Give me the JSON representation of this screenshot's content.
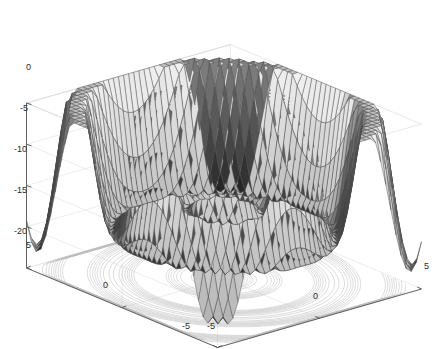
{
  "figure": {
    "type": "matlab-surfc-3d-surface",
    "background_color": "#ffffff",
    "width": 444,
    "height": 349
  },
  "chart_data": {
    "type": "surface",
    "title": "",
    "xlabel": "",
    "ylabel": "",
    "zlabel": "",
    "grid": true,
    "legend": null,
    "legend_position": "none",
    "style": "matlab surfc (surface with base contour projection), grayscale colormap",
    "projection": "3d axonometric, default MATLAB view az=-37.5 el=30",
    "xlim": [
      -5,
      5
    ],
    "ylim": [
      -5,
      5
    ],
    "zlim": [
      -20,
      0
    ],
    "x_ticks": [
      -5,
      0,
      5
    ],
    "y_ticks": [
      -5,
      0,
      5
    ],
    "z_ticks": [
      0,
      -5,
      -10,
      -15,
      -20
    ],
    "x_tick_labels": [
      "-5",
      "0",
      "5"
    ],
    "y_tick_labels": [
      "5",
      "0",
      "-5"
    ],
    "z_tick_labels": [
      "0",
      "-5",
      "-10",
      "-15",
      "-20"
    ],
    "surface": {
      "description": "Radially symmetric damped oscillating function; central dome peaks near z=0 surrounded by concentric ripple rings decreasing to about z=-20, with four outer wave crests rising back toward z=-5 at the domain corners/edges",
      "formula": "z = -abs(r) + A*cos(k*r) envelope, r = sqrt(x^2+y^2)",
      "grid_n": 41,
      "amplitude": 9.5,
      "wavenumber": 2.35,
      "decay": 0.0,
      "slope": 1.05,
      "offset": -1.0,
      "z_peak": 0.0,
      "z_min": -20.0
    },
    "colormap": {
      "name": "gray",
      "low": "#141414",
      "mid": "#9a9a9a",
      "high": "#f2f2f2"
    },
    "mesh": {
      "edge_color": "#4a4a4a",
      "edge_width": 0.45,
      "visible": true
    },
    "contour": {
      "visible": true,
      "levels": 10,
      "color": "#b9b9b9",
      "plane_z": -20
    },
    "axes": {
      "line_color": "#555555",
      "grid_color": "#e4e4e4",
      "box": true,
      "tick_color": "#2b2b2b"
    }
  },
  "tick_labels": {
    "z": [
      {
        "text": "0",
        "x": 26,
        "y": 63
      },
      {
        "text": "-5",
        "x": 20,
        "y": 104
      },
      {
        "text": "-10",
        "x": 14,
        "y": 145
      },
      {
        "text": "-15",
        "x": 14,
        "y": 186
      },
      {
        "text": "-20",
        "x": 14,
        "y": 227
      }
    ],
    "y_left": [
      {
        "text": "5",
        "x": 26,
        "y": 241
      },
      {
        "text": "0",
        "x": 103,
        "y": 281
      },
      {
        "text": "-5",
        "x": 182,
        "y": 322
      }
    ],
    "x_right": [
      {
        "text": "-5",
        "x": 207,
        "y": 322
      },
      {
        "text": "0",
        "x": 313,
        "y": 292
      },
      {
        "text": "5",
        "x": 424,
        "y": 262
      }
    ]
  }
}
